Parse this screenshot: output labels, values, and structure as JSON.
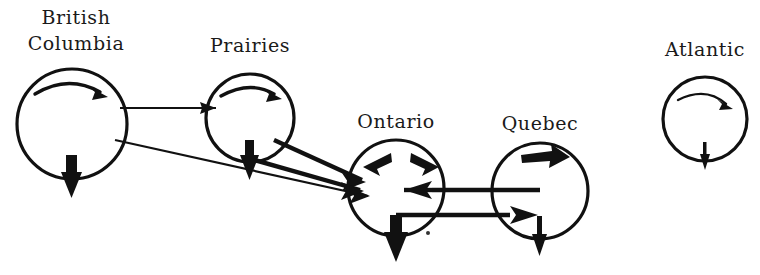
{
  "diagram": {
    "background_color": "#ffffff",
    "ink_color": "#111111",
    "nodes": [
      {
        "id": "british-columbia",
        "label": "British\nColumbia",
        "label_line1": "British",
        "label_line2": "Columbia",
        "cx": 72,
        "cy": 124,
        "r": 55,
        "internal_spin": "clockwise-arc-arrow",
        "out_migration_arrow": "down"
      },
      {
        "id": "prairies",
        "label": "Prairies",
        "label_line1": "Prairies",
        "label_line2": "",
        "cx": 250,
        "cy": 118,
        "r": 44,
        "internal_spin": "clockwise-arc-arrow",
        "out_migration_arrow": "down"
      },
      {
        "id": "ontario",
        "label": "Ontario",
        "label_line1": "Ontario",
        "label_line2": "",
        "cx": 396,
        "cy": 188,
        "r": 48,
        "internal_spin": "double-inward-arrowheads",
        "out_migration_arrow": "down"
      },
      {
        "id": "quebec",
        "label": "Quebec",
        "label_line1": "Quebec",
        "label_line2": "",
        "cx": 540,
        "cy": 191,
        "r": 48,
        "internal_spin": "right-arrow",
        "out_migration_arrow": "down"
      },
      {
        "id": "atlantic",
        "label": "Atlantic",
        "label_line1": "Atlantic",
        "label_line2": "",
        "cx": 705,
        "cy": 119,
        "r": 42,
        "internal_spin": "thin-arc-arrow",
        "out_migration_arrow": "down-small"
      }
    ],
    "flows": [
      {
        "id": "bc-to-prairies",
        "from": "british-columbia",
        "to": "prairies",
        "weight": "thin",
        "direction": "rightward"
      },
      {
        "id": "bc-to-ontario",
        "from": "british-columbia",
        "to": "ontario",
        "weight": "thin",
        "direction": "down-right"
      },
      {
        "id": "prairies-to-ontario-upper",
        "from": "prairies",
        "to": "ontario",
        "weight": "thick",
        "direction": "down-right"
      },
      {
        "id": "prairies-to-ontario-lower",
        "from": "prairies",
        "to": "ontario",
        "weight": "thick",
        "direction": "down-right"
      },
      {
        "id": "quebec-to-ontario",
        "from": "quebec",
        "to": "ontario",
        "weight": "thick",
        "direction": "leftward"
      },
      {
        "id": "ontario-to-quebec",
        "from": "ontario",
        "to": "quebec",
        "weight": "thick",
        "direction": "rightward"
      }
    ]
  }
}
